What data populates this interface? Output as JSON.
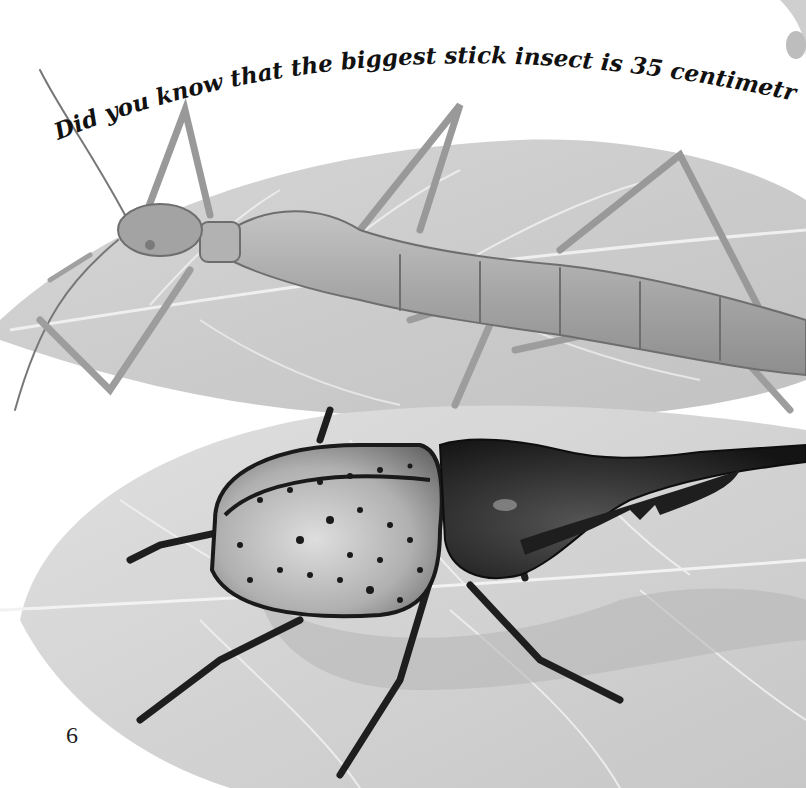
{
  "page": {
    "caption": "Did you know that the biggest stick insect is 35 centimetres long?",
    "page_number": "6"
  },
  "illustration": {
    "subjects": [
      "stick-insect",
      "hercules-beetle",
      "leaves"
    ],
    "colors": {
      "background": "#ffffff",
      "leaf_light": "#e2e2e2",
      "leaf_mid": "#c9c9c9",
      "leaf_vein": "#f4f4f4",
      "stick_insect_body": "#a9a9a9",
      "stick_insect_outline": "#6e6e6e",
      "beetle_elytra": "#bdbdbd",
      "beetle_spots": "#1a1a1a",
      "beetle_horn": "#1c1c1c",
      "caption_text": "#111111"
    }
  }
}
